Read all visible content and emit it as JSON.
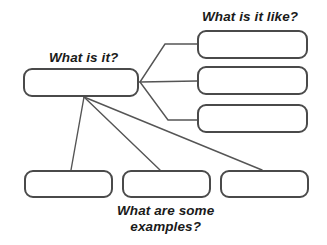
{
  "diagram": {
    "background_color": "#ffffff",
    "box_border_color": "#4a4a4a",
    "connector_color": "#555555",
    "text_color": "#1a1a1a",
    "labels": {
      "main": "What is it?",
      "like": "What is it like?",
      "examples_line1": "What are some",
      "examples_line2": "examples?"
    },
    "nodes": {
      "main": {
        "name": "main-concept-box",
        "value": ""
      },
      "like": [
        {
          "name": "attribute-box-1",
          "value": ""
        },
        {
          "name": "attribute-box-2",
          "value": ""
        },
        {
          "name": "attribute-box-3",
          "value": ""
        }
      ],
      "examples": [
        {
          "name": "example-box-1",
          "value": ""
        },
        {
          "name": "example-box-2",
          "value": ""
        },
        {
          "name": "example-box-3",
          "value": ""
        }
      ]
    }
  }
}
